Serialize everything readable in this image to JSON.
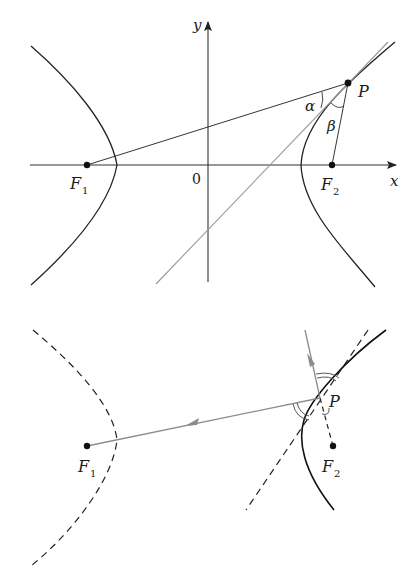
{
  "top_figure": {
    "axes": {
      "x_label": "x",
      "y_label": "y",
      "origin_label": "0"
    },
    "points": {
      "F1": {
        "label": "F",
        "sub": "1"
      },
      "F2": {
        "label": "F",
        "sub": "2"
      },
      "P": {
        "label": "P"
      }
    },
    "angles": {
      "alpha": "α",
      "beta": "β"
    },
    "colors": {
      "curve": "#222222",
      "tangent": "#999999",
      "axis": "#333333"
    }
  },
  "bottom_figure": {
    "points": {
      "F1": {
        "label": "F",
        "sub": "1"
      },
      "F2": {
        "label": "F",
        "sub": "2"
      },
      "P": {
        "label": "P"
      }
    },
    "colors": {
      "curve": "#111111",
      "ray": "#8c8c8c",
      "dashed": "#222222"
    }
  }
}
